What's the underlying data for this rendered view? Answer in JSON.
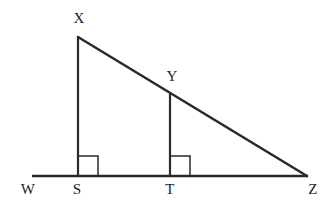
{
  "figure": {
    "background_color": "#ffffff",
    "stroke_color": "#2a2a2a",
    "label_color": "#232323",
    "width": 332,
    "height": 217
  },
  "labels": {
    "x": "X",
    "y": "Y",
    "w": "W",
    "s": "S",
    "t": "T",
    "z": "Z"
  },
  "label_positions": {
    "x": {
      "x": 79,
      "y": 18
    },
    "y": {
      "x": 172,
      "y": 76
    },
    "w": {
      "x": 28,
      "y": 189
    },
    "s": {
      "x": 77,
      "y": 189
    },
    "t": {
      "x": 170,
      "y": 189
    },
    "z": {
      "x": 313,
      "y": 189
    }
  },
  "points": {
    "X": {
      "x": 78,
      "y": 37
    },
    "Y": {
      "x": 170,
      "y": 94
    },
    "W": {
      "x": 32,
      "y": 176
    },
    "S": {
      "x": 78,
      "y": 176
    },
    "T": {
      "x": 170,
      "y": 176
    },
    "Z": {
      "x": 306,
      "y": 176
    }
  },
  "segments": [
    {
      "name": "baseline-wz",
      "from": "W",
      "to": "Z",
      "stroke_width": 2.6
    },
    {
      "name": "hypotenuse-xz",
      "from": "X",
      "to": "Z",
      "stroke_width": 2.6
    },
    {
      "name": "altitude-xs",
      "from": "X",
      "to": "S",
      "stroke_width": 2.2
    },
    {
      "name": "altitude-yt",
      "from": "Y",
      "to": "T",
      "stroke_width": 2.2
    }
  ],
  "right_angle_marks": [
    {
      "name": "right-angle-at-s",
      "vertex": "S",
      "size": 20,
      "direction": "right"
    },
    {
      "name": "right-angle-at-t",
      "vertex": "T",
      "size": 20,
      "direction": "right"
    }
  ]
}
